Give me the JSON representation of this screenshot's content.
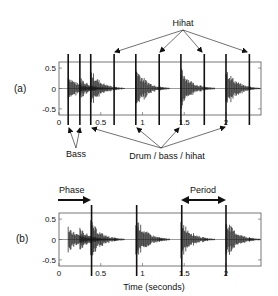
{
  "figure": {
    "panel_a_label": "(a)",
    "panel_b_label": "(b)",
    "xlabel": "Time (seconds)",
    "annotations_a": {
      "hihat": "Hihat",
      "bass": "Bass",
      "drum": "Drum / bass / hihat"
    },
    "annotations_b": {
      "phase": "Phase",
      "period": "Period"
    },
    "colors": {
      "ink": "#111111",
      "axis": "#555555",
      "wave": "#1a1a1a"
    }
  },
  "chart_data": [
    {
      "type": "line",
      "title": "(a) Audio waveform with onset markers",
      "xlabel": "",
      "ylabel": "",
      "xlim": [
        0,
        2.4
      ],
      "ylim": [
        -0.65,
        0.65
      ],
      "xticks": [
        "0",
        "0.5",
        "1",
        "1.5",
        "2"
      ],
      "yticks": [
        "0.5",
        "0",
        "-0.5"
      ],
      "grid": false,
      "onset_markers_sec": [
        0.11,
        0.25,
        0.38,
        0.66,
        0.92,
        1.2,
        1.46,
        1.74,
        2.0,
        2.28
      ],
      "onset_labels": {
        "Bass": [
          0.11,
          0.25
        ],
        "Drum / bass / hihat": [
          0.38,
          0.92,
          1.46,
          2.0
        ],
        "Hihat": [
          0.66,
          1.2,
          1.74,
          2.28
        ]
      },
      "waveform_peaks": [
        {
          "t": 0.11,
          "amp": 0.35
        },
        {
          "t": 0.25,
          "amp": 0.3
        },
        {
          "t": 0.38,
          "amp": 0.5
        },
        {
          "t": 0.66,
          "amp": 0.06
        },
        {
          "t": 0.92,
          "amp": 0.6
        },
        {
          "t": 1.2,
          "amp": 0.06
        },
        {
          "t": 1.46,
          "amp": 0.55
        },
        {
          "t": 1.74,
          "amp": 0.04
        },
        {
          "t": 2.0,
          "amp": 0.55
        },
        {
          "t": 2.28,
          "amp": 0.07
        }
      ]
    },
    {
      "type": "line",
      "title": "(b) Audio waveform with beat grid (phase and period)",
      "xlabel": "Time (seconds)",
      "ylabel": "",
      "xlim": [
        0,
        2.4
      ],
      "ylim": [
        -0.65,
        0.65
      ],
      "xticks": [
        "0",
        "0.5",
        "1",
        "1.5",
        "2"
      ],
      "yticks": [
        "0.5",
        "0",
        "-0.5"
      ],
      "grid": false,
      "beat_markers_sec": [
        0.39,
        0.93,
        1.47,
        2.0
      ],
      "phase_sec": 0.39,
      "period_sec": 0.54,
      "waveform_peaks": [
        {
          "t": 0.11,
          "amp": 0.35
        },
        {
          "t": 0.25,
          "amp": 0.3
        },
        {
          "t": 0.38,
          "amp": 0.5
        },
        {
          "t": 0.66,
          "amp": 0.06
        },
        {
          "t": 0.92,
          "amp": 0.6
        },
        {
          "t": 1.2,
          "amp": 0.06
        },
        {
          "t": 1.46,
          "amp": 0.55
        },
        {
          "t": 1.74,
          "amp": 0.04
        },
        {
          "t": 2.0,
          "amp": 0.55
        },
        {
          "t": 2.28,
          "amp": 0.07
        }
      ]
    }
  ]
}
